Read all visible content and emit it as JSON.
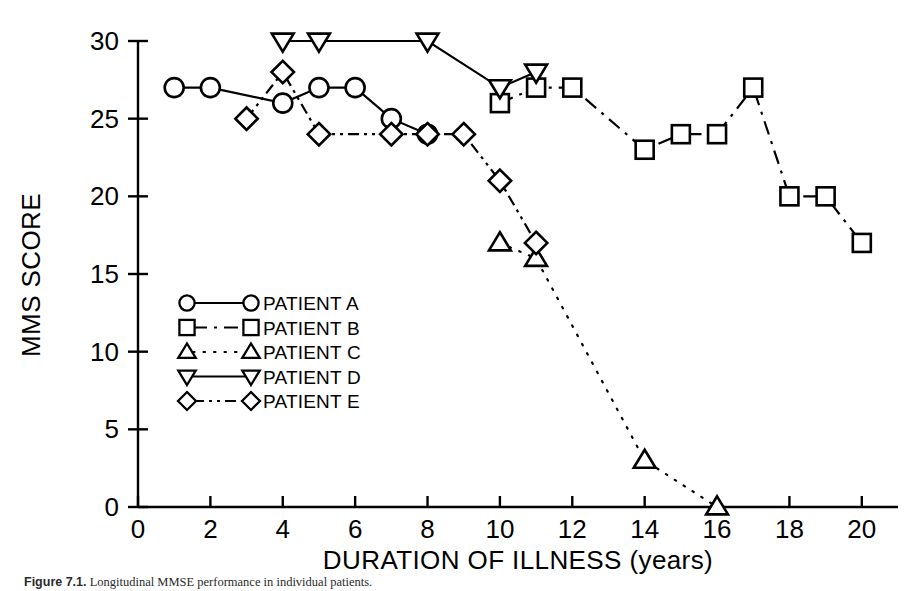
{
  "figure": {
    "caption_lead": "Figure 7.1.",
    "caption_rest": " Longitudinal MMSE performance in individual patients."
  },
  "chart_data": {
    "type": "line",
    "title": "",
    "xlabel": "DURATION OF ILLNESS (years)",
    "ylabel": "MMS SCORE",
    "xlim": [
      0,
      21
    ],
    "ylim": [
      0,
      30
    ],
    "xticks": [
      0,
      2,
      4,
      6,
      8,
      10,
      12,
      14,
      16,
      18,
      20
    ],
    "yticks": [
      0,
      5,
      10,
      15,
      20,
      25,
      30
    ],
    "xtick_labels": [
      "0",
      "2",
      "4",
      "6",
      "8",
      "10",
      "12",
      "14",
      "16",
      "18",
      "20"
    ],
    "ytick_labels": [
      "0",
      "5",
      "10",
      "15",
      "20",
      "25",
      "30"
    ],
    "grid": false,
    "legend_position": "inside-lower-left",
    "series": [
      {
        "name": "PATIENT A",
        "marker": "circle",
        "dash": "solid",
        "x": [
          1,
          2,
          4,
          5,
          6,
          7,
          8
        ],
        "y": [
          27,
          27,
          26,
          27,
          27,
          25,
          24
        ]
      },
      {
        "name": "PATIENT B",
        "marker": "square",
        "dash": "dashdot",
        "x": [
          10,
          11,
          12,
          14,
          15,
          16,
          17,
          18,
          19,
          20
        ],
        "y": [
          26,
          27,
          27,
          23,
          24,
          24,
          27,
          20,
          20,
          17
        ]
      },
      {
        "name": "PATIENT C",
        "marker": "triangle-up",
        "dash": "dotted",
        "x": [
          10,
          11,
          14,
          16
        ],
        "y": [
          17,
          16,
          3,
          0
        ]
      },
      {
        "name": "PATIENT D",
        "marker": "triangle-down",
        "dash": "solid",
        "x": [
          4,
          5,
          8,
          10,
          11
        ],
        "y": [
          30,
          30,
          30,
          27,
          28
        ]
      },
      {
        "name": "PATIENT E",
        "marker": "diamond",
        "dash": "dashdotdot",
        "x": [
          3,
          4,
          5,
          7,
          8,
          9,
          10,
          11
        ],
        "y": [
          25,
          28,
          24,
          24,
          24,
          24,
          21,
          17
        ]
      }
    ]
  },
  "legend": {
    "entries": [
      {
        "label": "PATIENT A",
        "marker": "circle",
        "dash": "solid"
      },
      {
        "label": "PATIENT B",
        "marker": "square",
        "dash": "dashdot"
      },
      {
        "label": "PATIENT C",
        "marker": "triangle-up",
        "dash": "dotted"
      },
      {
        "label": "PATIENT D",
        "marker": "triangle-down",
        "dash": "solid"
      },
      {
        "label": "PATIENT E",
        "marker": "diamond",
        "dash": "dashdotdot"
      }
    ]
  },
  "colors": {
    "ink": "#000000",
    "background": "#ffffff"
  }
}
